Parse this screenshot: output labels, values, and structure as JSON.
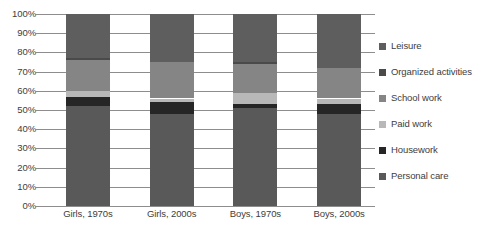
{
  "chart_data": {
    "type": "bar",
    "subtype": "stacked-100-percent",
    "title": "",
    "xlabel": "",
    "ylabel": "",
    "ylim": [
      0,
      100
    ],
    "grid": true,
    "legend_position": "right",
    "categories": [
      "Girls, 1970s",
      "Girls, 2000s",
      "Boys, 1970s",
      "Boys, 2000s"
    ],
    "ytick_labels": [
      "100%",
      "90%",
      "80%",
      "70%",
      "60%",
      "50%",
      "40%",
      "30%",
      "20%",
      "10%",
      "0%"
    ],
    "ytick_values": [
      100,
      90,
      80,
      70,
      60,
      50,
      40,
      30,
      20,
      10,
      0
    ],
    "stack_order_bottom_to_top": [
      "Personal care",
      "Housework",
      "Paid work",
      "School work",
      "Organized activities",
      "Leisure"
    ],
    "legend_order_top_to_bottom": [
      "Leisure",
      "Organized activities",
      "School work",
      "Paid work",
      "Housework",
      "Personal care"
    ],
    "series": [
      {
        "name": "Personal care",
        "color": "#595959",
        "values": [
          52,
          48,
          51,
          48
        ]
      },
      {
        "name": "Housework",
        "color": "#262626",
        "values": [
          5,
          6,
          2,
          5
        ]
      },
      {
        "name": "Paid work",
        "color": "#b8b8b8",
        "values": [
          3,
          2,
          6,
          3
        ]
      },
      {
        "name": "School work",
        "color": "#858585",
        "values": [
          16,
          19,
          15,
          16
        ]
      },
      {
        "name": "Organized activities",
        "color": "#4a4a4a",
        "values": [
          1,
          0,
          1,
          0
        ]
      },
      {
        "name": "Leisure",
        "color": "#5e5e5e",
        "values": [
          23,
          25,
          25,
          28
        ]
      }
    ]
  },
  "legend": {
    "items": [
      {
        "label": "Leisure",
        "color": "#5e5e5e"
      },
      {
        "label": "Organized activities",
        "color": "#4a4a4a"
      },
      {
        "label": "School work",
        "color": "#858585"
      },
      {
        "label": "Paid work",
        "color": "#b8b8b8"
      },
      {
        "label": "Housework",
        "color": "#262626"
      },
      {
        "label": "Personal care",
        "color": "#595959"
      }
    ]
  },
  "style": {
    "gridline_color": "#8d8d8d",
    "text_color": "#3d3d3d",
    "background": "#ffffff"
  }
}
